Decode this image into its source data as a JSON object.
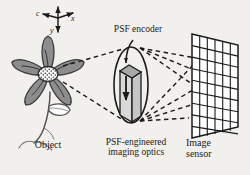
{
  "figure": {
    "background_color": "#f2f0ed",
    "ink_color": "#1a1a1a",
    "petal_fill": "#8d8d8d",
    "prism_fill": "#d0d0d0",
    "prism_top_fill": "#a8a8a8"
  },
  "axes": {
    "z_label": "c",
    "x_label": "x",
    "y_label": "y"
  },
  "labels": {
    "psf_encoder": "PSF encoder",
    "object": "Object",
    "optics": "PSF-engineered\nimaging optics",
    "sensor": "Image\nsensor"
  },
  "sensor": {
    "columns": 6,
    "rows": 9
  },
  "rays": {
    "object_to_lens": 2,
    "lens_to_sensor": 6
  }
}
